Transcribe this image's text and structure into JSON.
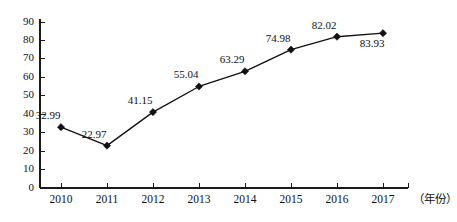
{
  "chart_data": {
    "type": "line",
    "title": "",
    "xlabel": "（年份）",
    "ylabel": "",
    "categories": [
      "2010",
      "2011",
      "2012",
      "2013",
      "2014",
      "2015",
      "2016",
      "2017"
    ],
    "values": [
      32.99,
      22.97,
      41.15,
      55.04,
      63.29,
      74.98,
      82.02,
      83.93
    ],
    "point_labels": [
      "32.99",
      "22.97",
      "41.15",
      "55.04",
      "63.29",
      "74.98",
      "82.02",
      "83.93"
    ],
    "series": [
      {
        "name": "",
        "values": [
          32.99,
          22.97,
          41.15,
          55.04,
          63.29,
          74.98,
          82.02,
          83.93
        ]
      }
    ],
    "ylim": [
      0,
      90
    ],
    "ytick_step": 10,
    "ytick_labels": [
      "0",
      "10",
      "20",
      "30",
      "40",
      "50",
      "60",
      "70",
      "80",
      "90"
    ],
    "grid": false,
    "legend": false,
    "legend_position": "none",
    "marker": "diamond",
    "line_color": "#111111",
    "marker_color": "#111111",
    "axis_color": "#1a1a1a",
    "background_color": "#ffffff",
    "label_placement": [
      "above-left",
      "above-left",
      "above-left",
      "above-left",
      "above-left",
      "above-left",
      "above-left",
      "below-left"
    ]
  }
}
